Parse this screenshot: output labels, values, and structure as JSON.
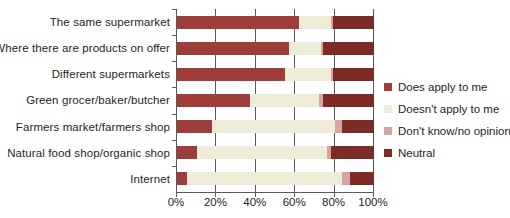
{
  "figure": {
    "background": "#ffffff",
    "axis_color": "#58595B",
    "text_color": "#231F20"
  },
  "chart_data": {
    "type": "bar",
    "stacked": true,
    "orientation": "horizontal",
    "title": "",
    "xlabel": "",
    "ylabel": "",
    "categories": [
      "The same supermarket",
      "Where there are products on offer",
      "Different supermarkets",
      "Green grocer/baker/butcher",
      "Farmers market/farmers shop",
      "Natural food shop/organic shop",
      "Internet"
    ],
    "series": [
      {
        "name": "Does apply to me",
        "color": "#9E3D3A",
        "values": [
          62,
          57,
          55,
          37,
          18,
          10,
          5
        ]
      },
      {
        "name": "Doesn't apply to me",
        "color": "#EFEBD9",
        "values": [
          16,
          16,
          23,
          35,
          62,
          66,
          79
        ]
      },
      {
        "name": "Don't know/no opinion",
        "color": "#D6A5A2",
        "values": [
          1,
          1,
          1,
          2,
          4,
          2,
          4
        ]
      },
      {
        "name": "Neutral",
        "color": "#7C2B25",
        "values": [
          21,
          26,
          21,
          26,
          16,
          22,
          12
        ]
      }
    ],
    "x_ticks": [
      "0%",
      "20%",
      "40%",
      "60%",
      "80%",
      "100%"
    ],
    "x_tick_values": [
      0,
      20,
      40,
      60,
      80,
      100
    ],
    "xlim": [
      0,
      100
    ],
    "grid": "vertical",
    "legend_position": "right"
  }
}
